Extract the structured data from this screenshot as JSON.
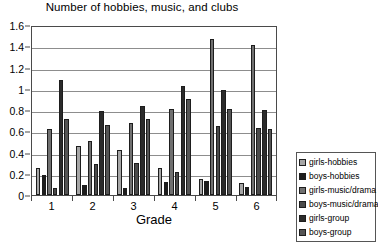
{
  "chart_data": {
    "type": "bar",
    "title": "Number of hobbies, music, and clubs",
    "xlabel": "Grade",
    "ylabel": "",
    "categories": [
      "1",
      "2",
      "3",
      "4",
      "5",
      "6"
    ],
    "ylim": [
      0,
      1.6
    ],
    "yticks": [
      "0",
      "0.2",
      "0.4",
      "0.6",
      "0.8",
      "1",
      "1.2",
      "1.4",
      "1.6"
    ],
    "ytick_values": [
      0,
      0.2,
      0.4,
      0.6,
      0.8,
      1,
      1.2,
      1.4,
      1.6
    ],
    "grid": true,
    "legend_position": "right",
    "series": [
      {
        "name": "girls-hobbies",
        "color": "#a6a6a6",
        "values": [
          0.25,
          0.46,
          0.42,
          0.25,
          0.15,
          0.11
        ]
      },
      {
        "name": "boys-hobbies",
        "color": "#1d1d1d",
        "values": [
          0.19,
          0.09,
          0.07,
          0.12,
          0.13,
          0.08
        ]
      },
      {
        "name": "girls-music/drama",
        "color": "#707070",
        "values": [
          0.62,
          0.51,
          0.68,
          0.81,
          1.47,
          1.41
        ]
      },
      {
        "name": "boys-music/drama",
        "color": "#4a4a4a",
        "values": [
          0.07,
          0.29,
          0.3,
          0.22,
          0.65,
          0.63
        ]
      },
      {
        "name": "girls-group",
        "color": "#2b2b2b",
        "values": [
          1.08,
          0.79,
          0.84,
          1.03,
          0.99,
          0.8
        ]
      },
      {
        "name": "boys-group",
        "color": "#555555",
        "values": [
          0.72,
          0.66,
          0.72,
          0.9,
          0.81,
          0.62
        ]
      }
    ]
  }
}
